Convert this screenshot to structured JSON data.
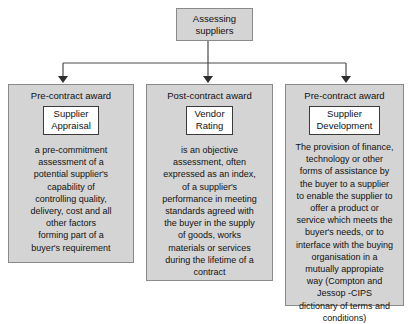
{
  "diagram": {
    "type": "flowchart",
    "orientation": "top-down",
    "colors": {
      "node_fill": "#d4d4d4",
      "node_border": "#8a8a8a",
      "term_fill": "#ffffff",
      "term_border": "#3a3a3a",
      "connector": "#4a4a4a",
      "text": "#111111",
      "background": "#ffffff"
    },
    "root": {
      "label": "Assessing\nsuppliers"
    },
    "branches": [
      {
        "phase": "Pre-contract award",
        "term": "Supplier\nAppraisal",
        "definition": "a pre-commitment\nassessment of a\npotential supplier's\ncapability of\ncontrolling quality,\ndelivery, cost and all\nother factors\nforming part of a\nbuyer's requirement"
      },
      {
        "phase": "Post-contract award",
        "term": "Vendor\nRating",
        "definition": "is an objective\nassessment, often\nexpressed as an index,\nof a supplier's\nperformance in meeting\nstandards agreed with\nthe buyer in the supply\nof goods, works\nmaterials or services\nduring the lifetime of a\ncontract"
      },
      {
        "phase": "Pre-contract award",
        "term": "Supplier\nDevelopment",
        "definition": "The provision of finance,\ntechnology or other\nforms of assistance by\nthe buyer to a supplier\nto enable the supplier to\noffer a product or\nservice which meets the\nbuyer's needs, or to\ninterface with the buying\norganisation in a\nmutually appropiate\nway (Compton and\nJessop -CIPS\ndictionary of terms and\nconditions)"
      }
    ]
  }
}
